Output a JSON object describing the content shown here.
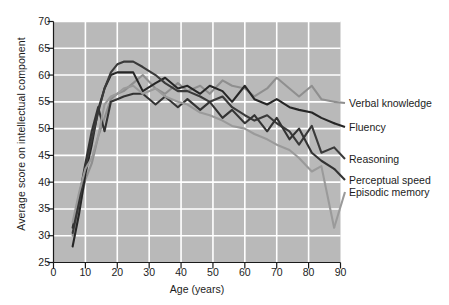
{
  "chart_data": {
    "type": "line",
    "title": "",
    "xlabel": "Age (years)",
    "ylabel": "Average score on intellectual component",
    "xlim": [
      0,
      90
    ],
    "ylim": [
      25,
      70
    ],
    "xticks": [
      0,
      10,
      20,
      30,
      40,
      50,
      60,
      70,
      80,
      90
    ],
    "yticks": [
      25,
      30,
      35,
      40,
      45,
      50,
      55,
      60,
      65,
      70
    ],
    "grid": true,
    "grid_color": "#ffffff",
    "plot_background": "#b9b9b9",
    "legend_position": "right-outside",
    "x": [
      6,
      8,
      10,
      12,
      14,
      16,
      18,
      20,
      22,
      25,
      28,
      32,
      35,
      39,
      42,
      46,
      49,
      53,
      56,
      60,
      63,
      67,
      70,
      74,
      77,
      81,
      84,
      88
    ],
    "series": [
      {
        "name": "Verbal knowledge",
        "color": "#8f8f8f",
        "label_y_px": 103,
        "values": [
          30.0,
          35.0,
          40.5,
          43.5,
          48.5,
          52.0,
          55.5,
          56.5,
          57.0,
          58.5,
          60.0,
          57.5,
          56.5,
          58.5,
          57.0,
          58.0,
          56.5,
          59.0,
          58.0,
          57.5,
          56.0,
          57.5,
          59.5,
          57.5,
          56.0,
          58.0,
          55.5,
          55.0
        ]
      },
      {
        "name": "Fluency",
        "color": "#262626",
        "label_y_px": 127,
        "values": [
          28.0,
          34.0,
          41.5,
          47.0,
          53.5,
          57.5,
          60.0,
          60.5,
          60.5,
          60.5,
          57.0,
          58.5,
          59.5,
          57.5,
          58.0,
          56.5,
          58.0,
          57.0,
          55.0,
          58.0,
          55.5,
          54.5,
          55.5,
          54.0,
          53.5,
          53.0,
          52.0,
          51.0
        ]
      },
      {
        "name": "Reasoning",
        "color": "#3a3a3a",
        "label_y_px": 159,
        "values": [
          30.5,
          36.0,
          43.0,
          48.0,
          53.0,
          57.5,
          60.5,
          62.0,
          62.5,
          62.5,
          61.5,
          60.0,
          58.5,
          57.0,
          57.0,
          56.0,
          55.0,
          56.0,
          54.0,
          52.5,
          51.5,
          52.5,
          51.0,
          49.5,
          47.0,
          50.5,
          45.5,
          46.5
        ]
      },
      {
        "name": "Perceptual speed",
        "color": "#333333",
        "label_y_px": 180,
        "values": [
          31.5,
          37.0,
          43.5,
          49.5,
          54.0,
          49.5,
          55.0,
          55.5,
          56.0,
          56.5,
          56.5,
          54.5,
          56.0,
          54.0,
          55.5,
          53.5,
          55.0,
          52.0,
          53.5,
          51.0,
          52.5,
          49.5,
          52.0,
          48.0,
          50.0,
          45.5,
          44.0,
          42.5
        ]
      },
      {
        "name": "Episodic memory",
        "color": "#9a9a9a",
        "label_y_px": 192,
        "values": [
          32.5,
          38.0,
          42.5,
          44.5,
          48.5,
          54.5,
          56.0,
          56.5,
          57.5,
          58.0,
          56.5,
          57.5,
          56.0,
          55.0,
          54.5,
          53.0,
          52.5,
          51.5,
          50.5,
          50.0,
          49.0,
          48.0,
          47.0,
          46.0,
          44.5,
          42.0,
          43.0,
          31.5
        ]
      }
    ]
  }
}
